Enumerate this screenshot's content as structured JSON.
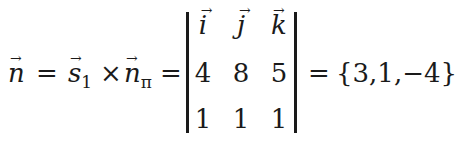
{
  "equation": {
    "lhs": {
      "symbol": "n",
      "arrow": "→"
    },
    "eq1": "=",
    "term1": {
      "symbol": "s",
      "subscript": "1",
      "arrow": "→"
    },
    "times": "×",
    "term2": {
      "symbol": "n",
      "subscript": "π",
      "arrow": "→"
    },
    "eq2": "=",
    "determinant": {
      "rows": [
        [
          {
            "value": "i",
            "vector": true
          },
          {
            "value": "j",
            "vector": true
          },
          {
            "value": "k",
            "vector": true
          }
        ],
        [
          {
            "value": "4"
          },
          {
            "value": "8"
          },
          {
            "value": "5"
          }
        ],
        [
          {
            "value": "1"
          },
          {
            "value": "1"
          },
          {
            "value": "1"
          }
        ]
      ]
    },
    "eq3": "=",
    "result": "{3,1,−4}"
  }
}
